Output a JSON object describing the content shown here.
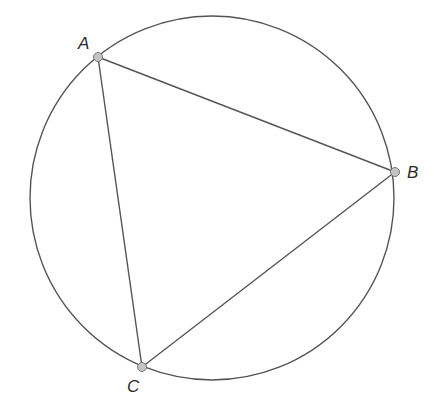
{
  "diagram": {
    "type": "inscribed-triangle-in-circle",
    "colors": {
      "stroke": "#555555",
      "point_fill": "#c4c4c4",
      "point_stroke": "#7a7a7a",
      "label": "#2a2a2a",
      "background": "#ffffff"
    },
    "circle": {
      "cx": 212,
      "cy": 198,
      "r": 182
    },
    "points": [
      {
        "name": "A",
        "label": "A",
        "x": 98,
        "y": 57,
        "label_x": 78,
        "label_y": 49
      },
      {
        "name": "B",
        "label": "B",
        "x": 395,
        "y": 172,
        "label_x": 407,
        "label_y": 178
      },
      {
        "name": "C",
        "label": "C",
        "x": 142,
        "y": 367,
        "label_x": 127,
        "label_y": 392
      }
    ],
    "segments": [
      {
        "from": "A",
        "to": "B"
      },
      {
        "from": "B",
        "to": "C"
      },
      {
        "from": "C",
        "to": "A"
      }
    ]
  }
}
